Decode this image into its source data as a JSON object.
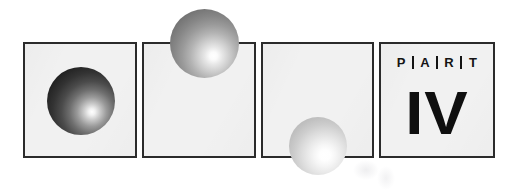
{
  "page": {
    "width": 516,
    "height": 190,
    "background_color": "#ffffff",
    "kind": "book-part-divider-graphic"
  },
  "style": {
    "panel_fill": "#f1f1f1",
    "panel_border": "#2b2b2b",
    "ink_color": "#141414"
  },
  "panels": [
    {
      "id": "panel-1",
      "label": "dark-sphere-panel"
    },
    {
      "id": "panel-2",
      "label": "mid-sphere-panel"
    },
    {
      "id": "panel-3",
      "label": "light-sphere-panel"
    },
    {
      "id": "panel-4",
      "label": "part-label-panel"
    }
  ],
  "spheres": [
    {
      "id": "sphere-dark",
      "tone": "dark",
      "placement": "inside-panel-1"
    },
    {
      "id": "sphere-mid",
      "tone": "medium",
      "placement": "overlapping-top-edge-panel-2"
    },
    {
      "id": "sphere-light",
      "tone": "light",
      "placement": "overlapping-bottom-edge-panel-3"
    }
  ],
  "part_label": {
    "letters": [
      "P",
      "A",
      "R",
      "T"
    ],
    "separator": "|",
    "numeral": "IV"
  }
}
